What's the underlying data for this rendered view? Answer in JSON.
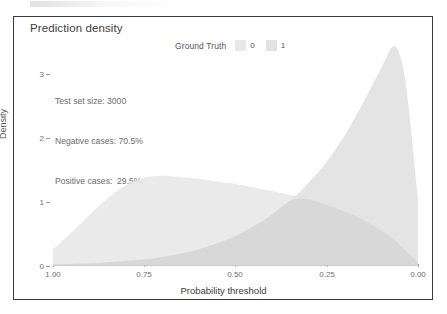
{
  "title": "Prediction density",
  "legend": {
    "title": "Ground Truth",
    "entries": [
      {
        "label": "0",
        "color": "#e8e8e8"
      },
      {
        "label": "1",
        "color": "#e2e2e2"
      }
    ]
  },
  "annotation": {
    "line1": "Test set size: 3000",
    "line2": "Negative cases: 70.5%",
    "line3": "Positive cases:  29.5%"
  },
  "axes": {
    "x_label": "Probability threshold",
    "y_label": "Density",
    "x_ticks": [
      "1.00",
      "0.75",
      "0.50",
      "0.25",
      "0.00"
    ],
    "y_ticks": [
      "3",
      "2",
      "1",
      "0"
    ]
  },
  "chart_data": {
    "type": "area",
    "title": "Prediction density",
    "xlabel": "Probability threshold",
    "ylabel": "Density",
    "xlim": [
      1.0,
      0.0
    ],
    "ylim": [
      0,
      3.5
    ],
    "x_reversed": true,
    "grid": false,
    "legend_position": "top",
    "legend_title": "Ground Truth",
    "annotations": [
      "Test set size: 3000",
      "Negative cases: 70.5%",
      "Positive cases:  29.5%"
    ],
    "x": [
      1.0,
      0.95,
      0.9,
      0.85,
      0.8,
      0.75,
      0.7,
      0.65,
      0.6,
      0.55,
      0.5,
      0.45,
      0.4,
      0.35,
      0.3,
      0.25,
      0.2,
      0.15,
      0.1,
      0.07,
      0.05,
      0.03,
      0.0
    ],
    "series": [
      {
        "name": "0",
        "color": "#e8e8e8",
        "values": [
          0.26,
          0.52,
          0.8,
          1.06,
          1.26,
          1.38,
          1.41,
          1.39,
          1.36,
          1.32,
          1.28,
          1.23,
          1.17,
          1.11,
          1.04,
          0.95,
          0.85,
          0.72,
          0.55,
          0.43,
          0.33,
          0.22,
          0.05
        ]
      },
      {
        "name": "1",
        "color": "#e2e2e2",
        "values": [
          0.02,
          0.03,
          0.04,
          0.06,
          0.08,
          0.1,
          0.14,
          0.19,
          0.26,
          0.35,
          0.47,
          0.62,
          0.8,
          1.02,
          1.3,
          1.63,
          2.05,
          2.55,
          3.1,
          3.42,
          3.3,
          2.7,
          1.05
        ]
      }
    ]
  }
}
